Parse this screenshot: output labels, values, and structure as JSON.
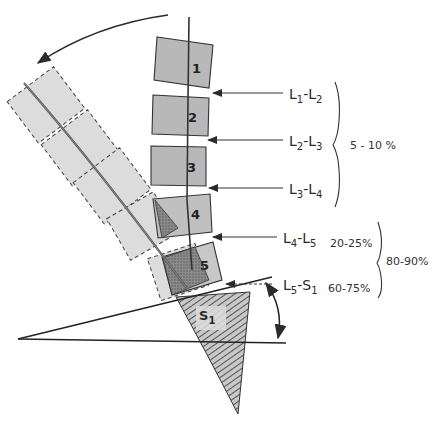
{
  "diagram": {
    "vertebrae": [
      {
        "id": "1",
        "label": "1"
      },
      {
        "id": "2",
        "label": "2"
      },
      {
        "id": "3",
        "label": "3"
      },
      {
        "id": "4",
        "label": "4"
      },
      {
        "id": "5",
        "label": "5"
      }
    ],
    "sacrum": {
      "label_main": "S",
      "label_sub": "1"
    },
    "segments": [
      {
        "from": "L",
        "from_sub": "1",
        "to": "L",
        "to_sub": "2",
        "percent": ""
      },
      {
        "from": "L",
        "from_sub": "2",
        "to": "L",
        "to_sub": "3",
        "percent": ""
      },
      {
        "from": "L",
        "from_sub": "3",
        "to": "L",
        "to_sub": "4",
        "percent": ""
      },
      {
        "from": "L",
        "from_sub": "4",
        "to": "L",
        "to_sub": "5",
        "percent": "20-25%"
      },
      {
        "from": "L",
        "from_sub": "5",
        "to": "S",
        "to_sub": "1",
        "percent": "60-75%"
      }
    ],
    "group_upper": {
      "range": "5 - 10 %"
    },
    "group_lower": {
      "range": "80-90%"
    },
    "colors": {
      "line": "#2b2b2b",
      "vertebra_fill": "#b8b8b8",
      "vertebra_ghost_fill": "#d9d9d9",
      "dark_wedge": "#6e6e6e",
      "background": "#ffffff"
    }
  }
}
